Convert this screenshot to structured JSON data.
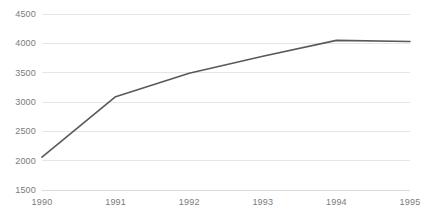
{
  "chart_data": {
    "type": "line",
    "title": "",
    "subtitle": "",
    "xlabel": "",
    "ylabel": "",
    "categories": [
      "1990",
      "1991",
      "1992",
      "1993",
      "1994",
      "1995"
    ],
    "x": [
      1990,
      1991,
      1992,
      1993,
      1994,
      1995
    ],
    "series": [
      {
        "name": "",
        "values": [
          2060,
          3090,
          3490,
          3780,
          4050,
          4030
        ],
        "color": "#595959",
        "line_width": 1.6
      }
    ],
    "ylim": [
      1500,
      4500
    ],
    "yticks": [
      1500,
      2000,
      2500,
      3000,
      3500,
      4000,
      4500
    ],
    "ytick_labels": [
      "1500",
      "2000",
      "2500",
      "3000",
      "3500",
      "4000",
      "4500"
    ],
    "xticks": [
      1990,
      1991,
      1992,
      1993,
      1994,
      1995
    ],
    "xtick_labels": [
      "1990",
      "1991",
      "1992",
      "1993",
      "1994",
      "1995"
    ],
    "grid": {
      "horizontal": true,
      "vertical": false,
      "color": "#e6e6e6"
    },
    "legend": {
      "visible": false,
      "position": "none"
    },
    "axis": {
      "x_axis_line": true,
      "x_axis_line_color": "#d9d9d9",
      "y_axis_line": false,
      "tick_label_color": "#7b7b7b",
      "tick_label_size_px": 9
    },
    "plot_area": {
      "left": 42,
      "right": 410,
      "top": 14,
      "bottom": 190
    },
    "background": "#ffffff"
  }
}
